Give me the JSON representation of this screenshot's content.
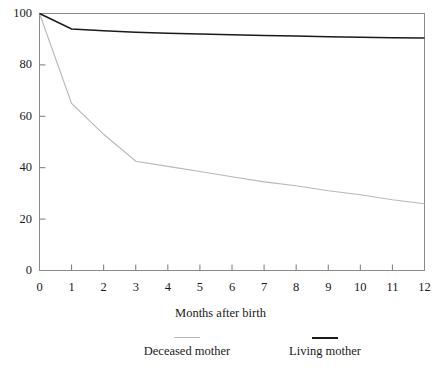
{
  "figure": {
    "clipped_top_text": "Survival by mother's living status",
    "width": 441,
    "height": 369
  },
  "axes": {
    "x_title": "Months after birth",
    "y_title": "",
    "x_ticks": [
      "0",
      "1",
      "2",
      "3",
      "4",
      "5",
      "6",
      "7",
      "8",
      "9",
      "10",
      "11",
      "12"
    ],
    "y_ticks": [
      "0",
      "20",
      "40",
      "60",
      "80",
      "100"
    ]
  },
  "legend": {
    "position": "below-axis",
    "entries": [
      {
        "label": "Deceased mother",
        "color": "#b8b8b8",
        "swatch": "line"
      },
      {
        "label": "Living mother",
        "color": "#1a1a1a",
        "swatch": "line"
      }
    ]
  },
  "chart_data": {
    "type": "line",
    "title": "",
    "xlabel": "Months after birth",
    "ylabel": "",
    "xlim": [
      0,
      12
    ],
    "ylim": [
      0,
      100
    ],
    "grid": false,
    "legend_position": "bottom",
    "x": [
      0,
      1,
      2,
      3,
      4,
      5,
      6,
      7,
      8,
      9,
      10,
      11,
      12
    ],
    "series": [
      {
        "name": "Deceased mother",
        "color": "#b8b8b8",
        "values": [
          100,
          65,
          53,
          42.5,
          40.5,
          38.5,
          36.5,
          34.5,
          33,
          31,
          29.5,
          27.5,
          26
        ]
      },
      {
        "name": "Living mother",
        "color": "#1a1a1a",
        "values": [
          100,
          94,
          93.3,
          92.7,
          92.3,
          92,
          91.7,
          91.4,
          91.2,
          91,
          90.8,
          90.6,
          90.5
        ]
      }
    ]
  },
  "colors": {
    "axis": "#7a7a7a",
    "frame": "#8a8a8a",
    "deceased": "#b8b8b8",
    "living": "#1a1a1a",
    "background": "#ffffff"
  }
}
